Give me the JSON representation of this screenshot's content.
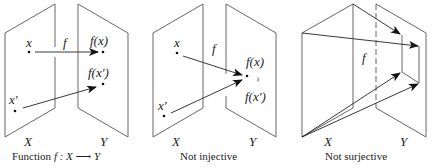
{
  "panels": [
    {
      "caption": "Function f : X → Y",
      "caption_parts": {
        "prefix": "Function ",
        "math": "f : X ⟶ Y"
      },
      "set_labels": {
        "domain": "X",
        "codomain": "Y"
      },
      "map_label": "f",
      "points": [
        {
          "label": "x",
          "image_label": "f(x)"
        },
        {
          "label": "x′",
          "image_label": "f(x′)"
        }
      ]
    },
    {
      "caption": "Not injective",
      "set_labels": {
        "domain": "X",
        "codomain": "Y"
      },
      "map_label": "f",
      "points": [
        {
          "label": "x"
        },
        {
          "label": "x′"
        }
      ],
      "image_labels": {
        "top": "f(x)",
        "equals": "=",
        "bottom": "f(x′)"
      }
    },
    {
      "caption": "Not surjective",
      "set_labels": {
        "domain": "X",
        "codomain": "Y"
      },
      "map_label": "f"
    }
  ]
}
